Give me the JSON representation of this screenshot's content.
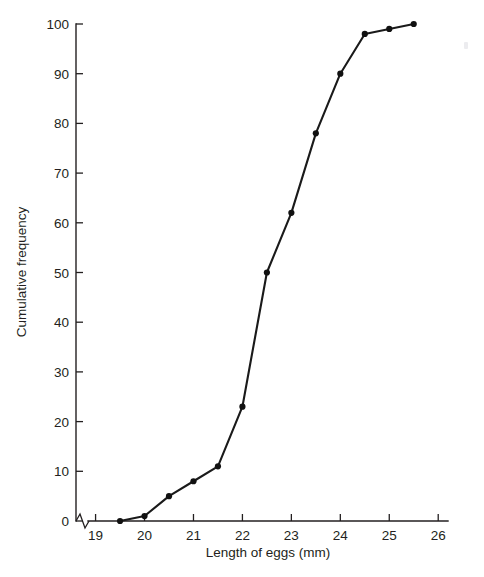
{
  "chart_data": {
    "type": "line",
    "title": "",
    "subtitle": "",
    "xlabel": "Length of eggs (mm)",
    "ylabel": "Cumulative frequency",
    "x": [
      19.5,
      20,
      20.5,
      21,
      21.5,
      22,
      22.5,
      23,
      23.5,
      24,
      24.5,
      25,
      25.5
    ],
    "values": [
      0,
      1,
      5,
      8,
      11,
      23,
      50,
      62,
      78,
      90,
      98,
      99,
      100
    ],
    "series": [
      {
        "name": "Cumulative frequency",
        "x": [
          19.5,
          20,
          20.5,
          21,
          21.5,
          22,
          22.5,
          23,
          23.5,
          24,
          24.5,
          25,
          25.5
        ],
        "values": [
          0,
          1,
          5,
          8,
          11,
          23,
          50,
          62,
          78,
          90,
          98,
          99,
          100
        ]
      }
    ],
    "xlim": [
      18.6,
      26.2
    ],
    "ylim": [
      0,
      100
    ],
    "x_ticks": [
      19,
      20,
      21,
      22,
      23,
      24,
      25,
      26
    ],
    "x_tick_labels": [
      "19",
      "20",
      "21",
      "22",
      "23",
      "24",
      "25",
      "26"
    ],
    "y_ticks": [
      0,
      10,
      20,
      30,
      40,
      50,
      60,
      70,
      80,
      90,
      100
    ],
    "y_tick_labels": [
      "0",
      "10",
      "20",
      "30",
      "40",
      "50",
      "60",
      "70",
      "80",
      "90",
      "100"
    ],
    "grid": false,
    "legend": false,
    "legend_position": "none",
    "axis_break": {
      "axis": "x",
      "present": true,
      "description": "zigzag break between origin and first tick"
    },
    "marker": "filled-circle",
    "line_color": "#1a1a1a",
    "marker_color": "#111111",
    "axis_color": "#231f20",
    "background_color": "#ffffff"
  },
  "axis_titles": {
    "x": "Length of eggs (mm)",
    "y": "Cumulative frequency"
  }
}
